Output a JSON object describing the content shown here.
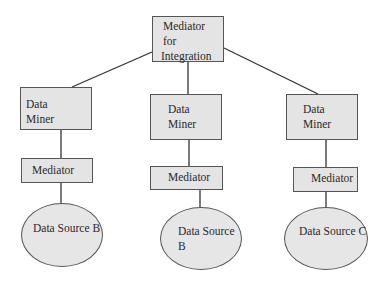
{
  "diagram": {
    "type": "hierarchy",
    "root": {
      "label_lines": [
        "Mediator",
        "for",
        "Integration"
      ]
    },
    "branches": [
      {
        "miner": {
          "label_lines": [
            "Data",
            "Miner"
          ]
        },
        "mediator": {
          "label": "Mediator"
        },
        "source": {
          "label_lines": [
            "Data",
            "Source B"
          ]
        }
      },
      {
        "miner": {
          "label_lines": [
            "Data",
            "Miner"
          ]
        },
        "mediator": {
          "label": "Mediator"
        },
        "source": {
          "label_lines": [
            "Data",
            "Source B"
          ]
        }
      },
      {
        "miner": {
          "label_lines": [
            "Data",
            "Miner"
          ]
        },
        "mediator": {
          "label": "Mediator"
        },
        "source": {
          "label_lines": [
            "Data",
            "Source C"
          ]
        }
      }
    ],
    "colors": {
      "box_fill": "#e4e4e4",
      "stroke": "#555555",
      "text": "#2a2a2a"
    }
  }
}
